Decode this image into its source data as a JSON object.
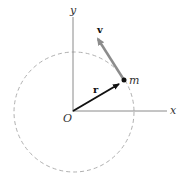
{
  "diagram": {
    "labels": {
      "y_axis": "y",
      "x_axis": "x",
      "origin": "O",
      "position_vector": "r",
      "velocity_vector": "v",
      "mass": "m"
    },
    "colors": {
      "axes": "#8a8a8a",
      "circle": "#b0b0b0",
      "position_vector": "#111111",
      "velocity_vector": "#8c8c8c",
      "mass_point": "#111111"
    }
  }
}
